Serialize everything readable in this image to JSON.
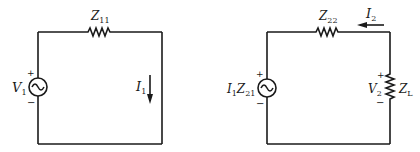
{
  "diagram": {
    "type": "circuit",
    "colors": {
      "ink": "#1a1a1a",
      "background": "#ffffff"
    },
    "left_circuit": {
      "source": {
        "label": "V",
        "subscript": "1",
        "polarity_plus": "+",
        "polarity_minus": "−",
        "icon": "ac-source-icon"
      },
      "series_impedance": {
        "label": "Z",
        "subscript": "11",
        "icon": "resistor-icon"
      },
      "current": {
        "label": "I",
        "subscript": "1",
        "direction": "down"
      }
    },
    "right_circuit": {
      "source": {
        "label_a": "I",
        "sub_a": "1",
        "label_b": "Z",
        "sub_b": "21",
        "polarity_plus": "+",
        "polarity_minus": "−",
        "icon": "ac-source-icon"
      },
      "series_impedance": {
        "label": "Z",
        "subscript": "22",
        "icon": "resistor-icon"
      },
      "current": {
        "label": "I",
        "subscript": "2",
        "direction": "left"
      },
      "load": {
        "label": "Z",
        "subscript": "L",
        "icon": "resistor-icon"
      },
      "load_voltage": {
        "label": "V",
        "subscript": "2",
        "polarity_plus": "+",
        "polarity_minus": "−"
      }
    }
  }
}
